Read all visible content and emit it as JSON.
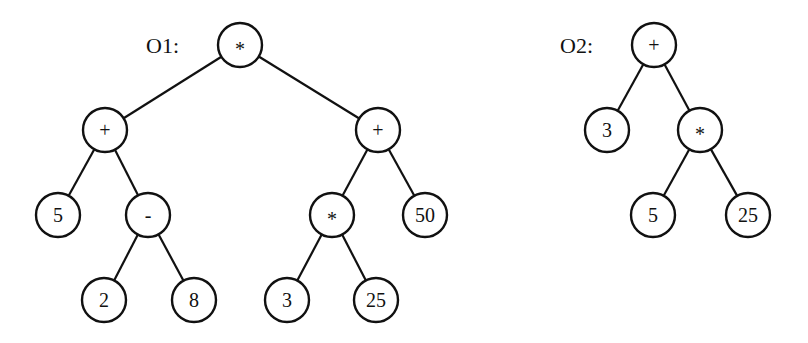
{
  "trees": [
    {
      "id": "O1",
      "label": "O1:",
      "label_pos": [
        146,
        45
      ],
      "nodes": [
        {
          "id": "n0",
          "value": "*",
          "x": 240,
          "y": 45
        },
        {
          "id": "n1",
          "value": "+",
          "x": 105,
          "y": 130
        },
        {
          "id": "n2",
          "value": "+",
          "x": 378,
          "y": 130
        },
        {
          "id": "n3",
          "value": "5",
          "x": 58,
          "y": 215
        },
        {
          "id": "n4",
          "value": "-",
          "x": 148,
          "y": 215
        },
        {
          "id": "n5",
          "value": "*",
          "x": 332,
          "y": 215
        },
        {
          "id": "n6",
          "value": "50",
          "x": 425,
          "y": 215
        },
        {
          "id": "n7",
          "value": "2",
          "x": 104,
          "y": 300
        },
        {
          "id": "n8",
          "value": "8",
          "x": 194,
          "y": 300
        },
        {
          "id": "n9",
          "value": "3",
          "x": 287,
          "y": 300
        },
        {
          "id": "n10",
          "value": "25",
          "x": 376,
          "y": 300
        }
      ],
      "edges": [
        [
          "n0",
          "n1"
        ],
        [
          "n0",
          "n2"
        ],
        [
          "n1",
          "n3"
        ],
        [
          "n1",
          "n4"
        ],
        [
          "n2",
          "n5"
        ],
        [
          "n2",
          "n6"
        ],
        [
          "n4",
          "n7"
        ],
        [
          "n4",
          "n8"
        ],
        [
          "n5",
          "n9"
        ],
        [
          "n5",
          "n10"
        ]
      ]
    },
    {
      "id": "O2",
      "label": "O2:",
      "label_pos": [
        560,
        45
      ],
      "nodes": [
        {
          "id": "m0",
          "value": "+",
          "x": 654,
          "y": 45
        },
        {
          "id": "m1",
          "value": "3",
          "x": 607,
          "y": 130
        },
        {
          "id": "m2",
          "value": "*",
          "x": 700,
          "y": 130
        },
        {
          "id": "m3",
          "value": "5",
          "x": 653,
          "y": 215
        },
        {
          "id": "m4",
          "value": "25",
          "x": 748,
          "y": 215
        }
      ],
      "edges": [
        [
          "m0",
          "m1"
        ],
        [
          "m0",
          "m2"
        ],
        [
          "m2",
          "m3"
        ],
        [
          "m2",
          "m4"
        ]
      ]
    }
  ],
  "node_radius": 22,
  "colors": {
    "stroke": "#111111",
    "fill": "#ffffff"
  }
}
